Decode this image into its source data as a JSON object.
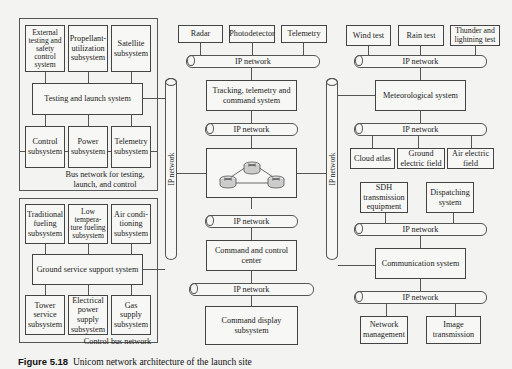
{
  "left": {
    "testing_group": {
      "top_boxes": [
        "External testing and safety control system",
        "Propellant-utilization subsystem",
        "Satellite subsystem"
      ],
      "center": "Testing and launch system",
      "bottom_boxes": [
        "Control subsystem",
        "Power subsystem",
        "Telemetry subsystem"
      ],
      "label": "Bus network for testing, launch, and control"
    },
    "ground_group": {
      "top_boxes": [
        "Traditional fueling subsystem",
        "Low tempera-ture fueling subsystem",
        "Air condi-tioning subsystem"
      ],
      "center": "Ground service support system",
      "bottom_boxes": [
        "Tower service subsystem",
        "Electrical power supply subsystem",
        "Gas supply subsystem"
      ],
      "label": "Control bus network"
    }
  },
  "center": {
    "sensors": [
      "Radar",
      "Photodetector",
      "Telemetry"
    ],
    "ip1": "IP network",
    "ttc": "Tracking, telemetry and command system",
    "ip2": "IP network",
    "router_cluster": "router-cluster",
    "ip3": "IP network",
    "c2": "Command and control center",
    "ip4": "IP network",
    "display": "Command display subsystem"
  },
  "backbones": {
    "left": "IP network",
    "right": "IP network"
  },
  "right": {
    "met_tests": [
      "Wind test",
      "Rain test",
      "Thunder and lightning test"
    ],
    "ip1": "IP network",
    "met": "Meteorological system",
    "ip2": "IP network",
    "met_outputs": [
      "Cloud atlas",
      "Ground electric field",
      "Air electric field"
    ],
    "comm_inputs": [
      "SDH transmission equipment",
      "Dispatching system"
    ],
    "ip3": "IP network",
    "comm": "Communication system",
    "ip4": "IP network",
    "comm_outputs": [
      "Network management",
      "Image transmission"
    ]
  },
  "caption": {
    "figure": "Figure 5.18",
    "text": "Unicom network architecture of the launch site"
  }
}
